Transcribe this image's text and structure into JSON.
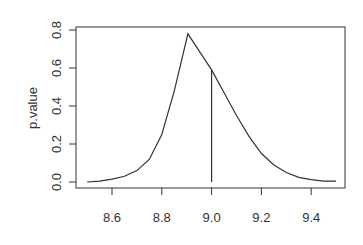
{
  "chart_data": {
    "type": "line",
    "title": "",
    "xlabel": "",
    "ylabel": "p.value",
    "xlim": [
      8.5,
      9.5
    ],
    "ylim": [
      0.0,
      0.8
    ],
    "grid": false,
    "legend": null,
    "x_ticks": [
      "8.6",
      "8.8",
      "9.0",
      "9.2",
      "9.4"
    ],
    "y_ticks": [
      "0.0",
      "0.2",
      "0.4",
      "0.6",
      "0.8"
    ],
    "series": [
      {
        "name": "p.value",
        "x": [
          8.5,
          8.55,
          8.6,
          8.65,
          8.7,
          8.75,
          8.8,
          8.85,
          8.905,
          8.95,
          9.0,
          9.05,
          9.1,
          9.15,
          9.2,
          9.25,
          9.3,
          9.35,
          9.4,
          9.45,
          9.5
        ],
        "values": [
          0.0,
          0.005,
          0.015,
          0.03,
          0.06,
          0.12,
          0.25,
          0.48,
          0.78,
          0.69,
          0.59,
          0.47,
          0.35,
          0.24,
          0.15,
          0.09,
          0.05,
          0.025,
          0.012,
          0.005,
          0.005
        ]
      }
    ],
    "annotations": [
      {
        "type": "vline",
        "x": 9.0,
        "y_from": 0.0,
        "y_to": 0.59
      }
    ]
  }
}
